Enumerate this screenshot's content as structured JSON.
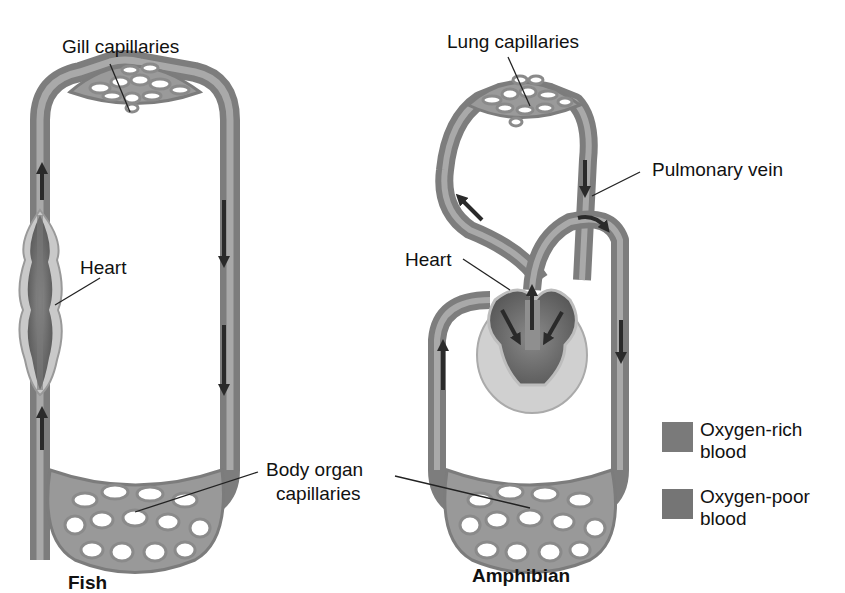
{
  "figure": {
    "panels": [
      {
        "id": "fish",
        "title": "Fish",
        "labels": {
          "top_capillaries": "Gill capillaries",
          "heart": "Heart"
        }
      },
      {
        "id": "amphibian",
        "title": "Amphibian",
        "labels": {
          "top_capillaries": "Lung capillaries",
          "pulmonary_vein": "Pulmonary vein",
          "heart": "Heart"
        }
      }
    ],
    "shared_labels": {
      "body_capillaries_line1": "Body organ",
      "body_capillaries_line2": "capillaries"
    },
    "legend": [
      {
        "label": "Oxygen-rich blood",
        "color": "#7a7a7a"
      },
      {
        "label": "Oxygen-poor blood",
        "color": "#757575"
      }
    ],
    "colors": {
      "vessel": "#8c8c8c",
      "vessel_dark": "#6a6a6a",
      "vessel_light": "#b0b0b0",
      "arrow": "#2a2a2a",
      "heart_pericardium": "#cfcfcf",
      "leader_line": "#222222"
    }
  }
}
